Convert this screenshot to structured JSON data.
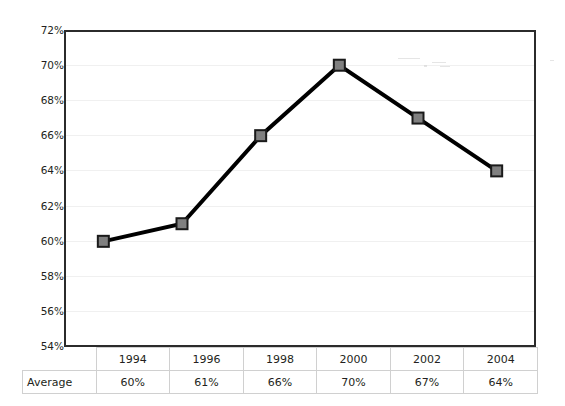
{
  "chart_data": {
    "type": "line",
    "title": "",
    "xlabel": "",
    "ylabel": "",
    "categories": [
      "1994",
      "1996",
      "1998",
      "2000",
      "2002",
      "2004"
    ],
    "series": [
      {
        "name": "Average",
        "values": [
          60,
          61,
          66,
          70,
          67,
          64
        ],
        "value_labels": [
          "60%",
          "61%",
          "66%",
          "70%",
          "67%",
          "64%"
        ]
      }
    ],
    "ylim": [
      54,
      72
    ],
    "ytick_step": 2,
    "ytick_labels": [
      "72%",
      "70%",
      "68%",
      "66%",
      "64%",
      "62%",
      "60%",
      "58%",
      "56%",
      "54%"
    ],
    "ytick_values": [
      72,
      70,
      68,
      66,
      64,
      62,
      60,
      58,
      56,
      54
    ],
    "grid": true,
    "legend": "none",
    "marker": "square",
    "colors": {
      "line": "#000000",
      "marker_fill": "#808080",
      "marker_border": "#1a1a1a",
      "plot_border": "#2b2b2b",
      "gridline": "#f0f0f0",
      "tick_mark": "#c9c9c9",
      "table_border": "#d0d0d0",
      "text": "#231f20",
      "background": "#ffffff"
    }
  },
  "table": {
    "row_header_label": "Average",
    "columns": [
      "1994",
      "1996",
      "1998",
      "2000",
      "2002",
      "2004"
    ],
    "values": [
      "60%",
      "61%",
      "66%",
      "70%",
      "67%",
      "64%"
    ]
  }
}
